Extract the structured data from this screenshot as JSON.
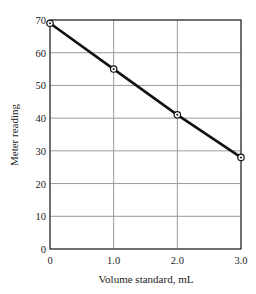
{
  "chart_data": {
    "type": "line",
    "title": "",
    "xlabel": "Volume standard, mL",
    "ylabel": "Meter reading",
    "x": [
      0,
      1.0,
      2.0,
      3.0
    ],
    "series": [
      {
        "name": "Meter reading",
        "values": [
          69,
          55,
          41,
          28
        ],
        "marker": "circle-dot",
        "color": "#111111"
      }
    ],
    "xlim": [
      0,
      3.0
    ],
    "ylim": [
      0,
      70
    ],
    "xticks": [
      0,
      1.0,
      2.0,
      3.0
    ],
    "xtick_labels": [
      "0",
      "1.0",
      "2.0",
      "3.0"
    ],
    "yticks": [
      0,
      10,
      20,
      30,
      40,
      50,
      60,
      70
    ],
    "ytick_labels": [
      "0",
      "10",
      "20",
      "30",
      "40",
      "50",
      "60",
      "70"
    ],
    "grid": true,
    "legend": "none"
  }
}
